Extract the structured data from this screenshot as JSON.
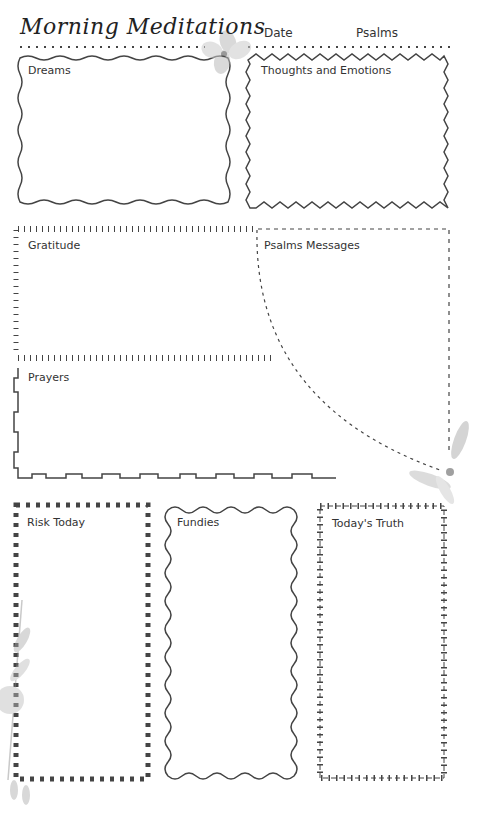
{
  "header": {
    "title": "Morning Meditations",
    "date_label": "Date",
    "psalms_label": "Psalms"
  },
  "sections": [
    {
      "id": "dreams",
      "label": "Dreams"
    },
    {
      "id": "thoughts",
      "label": "Thoughts and Emotions"
    },
    {
      "id": "gratitude",
      "label": "Gratitude"
    },
    {
      "id": "psalms-messages",
      "label": "Psalms Messages"
    },
    {
      "id": "prayers",
      "label": "Prayers"
    },
    {
      "id": "risk-today",
      "label": "Risk Today"
    },
    {
      "id": "fundies",
      "label": "Fundies"
    },
    {
      "id": "todays-truth",
      "label": "Today's Truth"
    }
  ],
  "colors": {
    "ink": "#333333",
    "flower": "#c8c8c8"
  }
}
